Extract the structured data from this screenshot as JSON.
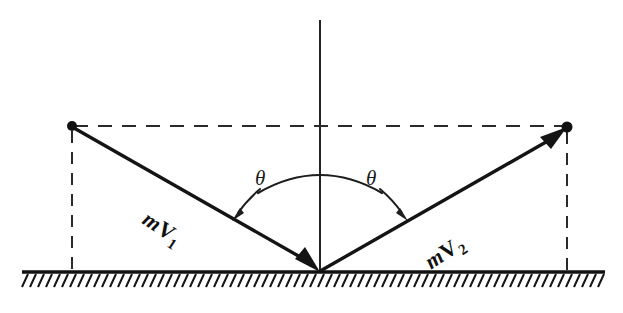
{
  "figure": {
    "background_color": "#ffffff",
    "ink_color": "#141414",
    "labels": {
      "incoming_vector": "mV1",
      "incoming_vector_base": "m",
      "incoming_vector_symbol": "V",
      "incoming_vector_subscript": "1",
      "outgoing_vector": "mV2",
      "outgoing_vector_base": "m",
      "outgoing_vector_symbol": "V",
      "outgoing_vector_subscript": "2",
      "angle_left": "θ",
      "angle_right": "θ"
    },
    "geometry": {
      "impact_point": [
        320,
        272
      ],
      "left_node": [
        72,
        126
      ],
      "right_node": [
        567,
        127
      ],
      "normal_top": [
        320,
        20
      ],
      "ground_y": 272,
      "ground_x_start": 22,
      "ground_x_end": 605,
      "hatch_spacing": 8,
      "hatch_length": 13,
      "hatch_lean_dx": -6,
      "angle_degrees": 33.5
    },
    "elements": {
      "normal_line": "vertical normal",
      "ground": "hatched surface",
      "horizontal_dashed": "dashed construction line between vector tips",
      "left_drop": "dashed vertical from left node to ground",
      "right_drop": "dashed vertical from right node to ground",
      "span_arc": "arc spanning both angles across the normal"
    }
  }
}
